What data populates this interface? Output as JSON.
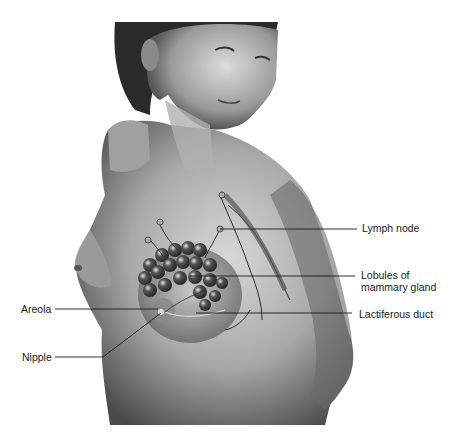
{
  "figure": {
    "labels": {
      "lymph_node": "Lymph node",
      "lobules_line1": "Lobules of",
      "lobules_line2": "mammary gland",
      "lactiferous_duct": "Lactiferous duct",
      "areola": "Areola",
      "nipple": "Nipple"
    }
  }
}
